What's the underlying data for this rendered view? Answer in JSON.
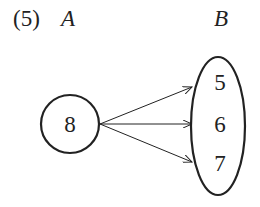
{
  "diagram": {
    "problem_label": "(5)",
    "set_a": {
      "label": "A",
      "elements": [
        "8"
      ]
    },
    "set_b": {
      "label": "B",
      "elements": [
        "5",
        "6",
        "7"
      ]
    },
    "mappings": [
      {
        "from": "8",
        "to": "5"
      },
      {
        "from": "8",
        "to": "6"
      },
      {
        "from": "8",
        "to": "7"
      }
    ],
    "colors": {
      "stroke": "#222222",
      "background": "#ffffff"
    }
  }
}
